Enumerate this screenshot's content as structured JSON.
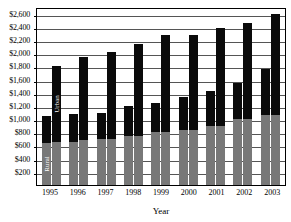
{
  "chart_data": {
    "type": "bar",
    "title": "",
    "xlabel": "Year",
    "ylabel": "",
    "ylim": [
      0,
      2700
    ],
    "ytick_step": 200,
    "grid": true,
    "legend_position": "in-bars",
    "stacked": true,
    "grouped": true,
    "categories": [
      "1995",
      "1996",
      "1997",
      "1998",
      "1999",
      "2000",
      "2001",
      "2002",
      "2003"
    ],
    "ytick_labels": [
      "$200",
      "$400",
      "$600",
      "$800",
      "$1,000",
      "$1,200",
      "$1,400",
      "$1,600",
      "$1,800",
      "$2,000",
      "$2,200",
      "$2,400",
      "$2,600"
    ],
    "ytick_values": [
      200,
      400,
      600,
      800,
      1000,
      1200,
      1400,
      1600,
      1800,
      2000,
      2200,
      2400,
      2600
    ],
    "series_names": [
      "Rural",
      "Urban"
    ],
    "series_colors": {
      "Rural": "#787878",
      "Urban": "#0a0a0a"
    },
    "annotations": [
      {
        "text": "Urban",
        "on": "1995-bar2-urban-segment"
      },
      {
        "text": "Rural",
        "on": "1995-bar1-rural-segment"
      }
    ],
    "groups": [
      {
        "category": "1995",
        "bars": [
          {
            "rural": 640,
            "urban": 400,
            "total": 1040
          },
          {
            "rural": 660,
            "urban": 1140,
            "total": 1800
          }
        ]
      },
      {
        "category": "1996",
        "bars": [
          {
            "rural": 660,
            "urban": 420,
            "total": 1080
          },
          {
            "rural": 680,
            "urban": 1260,
            "total": 1940
          }
        ]
      },
      {
        "category": "1997",
        "bars": [
          {
            "rural": 700,
            "urban": 400,
            "total": 1100
          },
          {
            "rural": 700,
            "urban": 1320,
            "total": 2020
          }
        ]
      },
      {
        "category": "1998",
        "bars": [
          {
            "rural": 740,
            "urban": 460,
            "total": 1200
          },
          {
            "rural": 740,
            "urban": 1400,
            "total": 2140
          }
        ]
      },
      {
        "category": "1999",
        "bars": [
          {
            "rural": 800,
            "urban": 440,
            "total": 1240
          },
          {
            "rural": 800,
            "urban": 1480,
            "total": 2280
          }
        ]
      },
      {
        "category": "2000",
        "bars": [
          {
            "rural": 840,
            "urban": 500,
            "total": 1340
          },
          {
            "rural": 840,
            "urban": 1440,
            "total": 2280
          }
        ]
      },
      {
        "category": "2001",
        "bars": [
          {
            "rural": 900,
            "urban": 520,
            "total": 1420
          },
          {
            "rural": 900,
            "urban": 1480,
            "total": 2380
          }
        ]
      },
      {
        "category": "2002",
        "bars": [
          {
            "rural": 1000,
            "urban": 540,
            "total": 1540
          },
          {
            "rural": 1000,
            "urban": 1460,
            "total": 2460
          }
        ]
      },
      {
        "category": "2003",
        "bars": [
          {
            "rural": 1060,
            "urban": 700,
            "total": 1760
          },
          {
            "rural": 1060,
            "urban": 1540,
            "total": 2600
          }
        ]
      }
    ]
  }
}
